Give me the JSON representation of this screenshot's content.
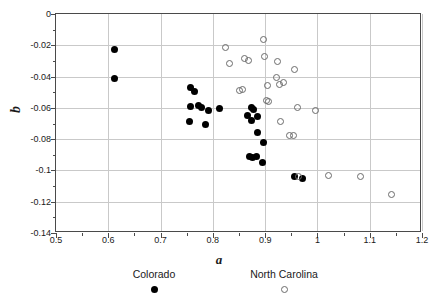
{
  "chart_data": {
    "type": "scatter",
    "title": "",
    "xlabel": "a",
    "ylabel": "b",
    "xlim": [
      0.5,
      1.2
    ],
    "ylim": [
      -0.14,
      0.0
    ],
    "xticks": [
      "0.5",
      "0.6",
      "0.7",
      "0.8",
      "0.9",
      "1",
      "1.1",
      "1.2"
    ],
    "xtick_values": [
      0.5,
      0.6,
      0.7,
      0.8,
      0.9,
      1.0,
      1.1,
      1.2
    ],
    "yticks": [
      "0",
      "-0.02",
      "-0.04",
      "-0.06",
      "-0.08",
      "-0.1",
      "-0.12",
      "-0.14"
    ],
    "ytick_values": [
      0,
      -0.02,
      -0.04,
      -0.06,
      -0.08,
      -0.1,
      -0.12,
      -0.14
    ],
    "grid": true,
    "legend_position": "below",
    "series": [
      {
        "name": "Colorado",
        "marker": "filled-circle",
        "color": "#000000",
        "points": [
          [
            0.611,
            -0.0228
          ],
          [
            0.611,
            -0.0413
          ],
          [
            0.757,
            -0.0473
          ],
          [
            0.764,
            -0.0495
          ],
          [
            0.757,
            -0.0593
          ],
          [
            0.772,
            -0.0585
          ],
          [
            0.779,
            -0.06
          ],
          [
            0.755,
            -0.0687
          ],
          [
            0.791,
            -0.0618
          ],
          [
            0.786,
            -0.0707
          ],
          [
            0.813,
            -0.0605
          ],
          [
            0.873,
            -0.0598
          ],
          [
            0.878,
            -0.061
          ],
          [
            0.866,
            -0.065
          ],
          [
            0.874,
            -0.068
          ],
          [
            0.885,
            -0.0658
          ],
          [
            0.886,
            -0.076
          ],
          [
            0.897,
            -0.082
          ],
          [
            0.871,
            -0.091
          ],
          [
            0.875,
            -0.0917
          ],
          [
            0.884,
            -0.0908
          ],
          [
            0.894,
            -0.0947
          ],
          [
            0.956,
            -0.1038
          ],
          [
            0.971,
            -0.1053
          ]
        ]
      },
      {
        "name": "North Carolina",
        "marker": "open-circle",
        "color": "#6b6b6b",
        "points": [
          [
            0.824,
            -0.0213
          ],
          [
            0.897,
            -0.0165
          ],
          [
            0.831,
            -0.0315
          ],
          [
            0.861,
            -0.0283
          ],
          [
            0.869,
            -0.0297
          ],
          [
            0.898,
            -0.0273
          ],
          [
            0.923,
            -0.0305
          ],
          [
            0.957,
            -0.0352
          ],
          [
            0.857,
            -0.0482
          ],
          [
            0.904,
            -0.0455
          ],
          [
            0.922,
            -0.0405
          ],
          [
            0.851,
            -0.0488
          ],
          [
            0.927,
            -0.045
          ],
          [
            0.935,
            -0.0438
          ],
          [
            0.903,
            -0.0553
          ],
          [
            0.906,
            -0.0558
          ],
          [
            0.961,
            -0.06
          ],
          [
            0.996,
            -0.062
          ],
          [
            0.929,
            -0.069
          ],
          [
            0.946,
            -0.0775
          ],
          [
            0.954,
            -0.0778
          ],
          [
            0.963,
            -0.1038
          ],
          [
            1.022,
            -0.103
          ],
          [
            1.082,
            -0.1038
          ],
          [
            1.142,
            -0.1152
          ]
        ]
      }
    ]
  }
}
